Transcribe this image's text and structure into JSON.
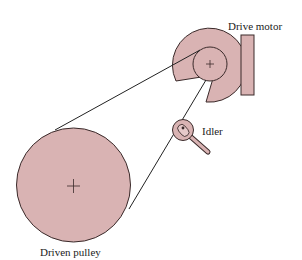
{
  "labels": {
    "drive_motor": "Drive motor",
    "idler": "Idler",
    "driven_pulley": "Driven pulley"
  },
  "colors": {
    "fill": "#d9b3b3",
    "stroke": "#3a2a2a",
    "text": "#222222"
  }
}
